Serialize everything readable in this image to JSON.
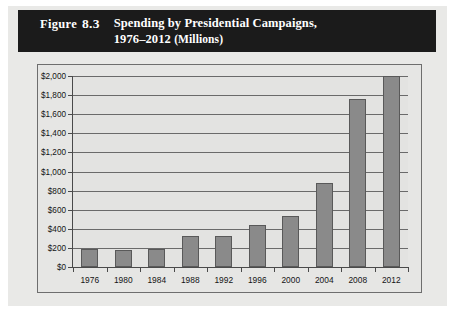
{
  "figure": {
    "label_word": "Figure",
    "number": "8.3",
    "title_line1": "Spending by Presidential Campaigns,",
    "title_line2_years": "1976–2012",
    "title_line2_unit": "(Millions)"
  },
  "colors": {
    "title_bar_bg": "#1b1b1b",
    "title_bar_text": "#ffffff",
    "bar_fill": "#8a8a8a",
    "bar_border": "#595959",
    "plot_bg": "#e3e3e1",
    "grid": "#6a6a6a",
    "axis": "#4a4a4a",
    "page_bg": "#e9e9e7"
  },
  "chart_data": {
    "type": "bar",
    "title": "Spending by Presidential Campaigns, 1976–2012 (Millions)",
    "xlabel": "",
    "ylabel": "",
    "categories": [
      "1976",
      "1980",
      "1984",
      "1988",
      "1992",
      "1996",
      "2000",
      "2004",
      "2008",
      "2012"
    ],
    "values": [
      185,
      180,
      190,
      320,
      330,
      440,
      530,
      880,
      1760,
      2000
    ],
    "ylim": [
      0,
      2000
    ],
    "ytick_values": [
      0,
      200,
      400,
      600,
      800,
      1000,
      1200,
      1400,
      1600,
      1800,
      2000
    ],
    "ytick_labels": [
      "$0",
      "$200",
      "$400",
      "$600",
      "$800",
      "$1,000",
      "$1,200",
      "$1,400",
      "$1,600",
      "$1,800",
      "$2,000"
    ],
    "grid": true,
    "legend": null,
    "series": [
      {
        "name": "Campaign spending (millions of dollars)",
        "values": [
          185,
          180,
          190,
          320,
          330,
          440,
          530,
          880,
          1760,
          2000
        ]
      }
    ]
  }
}
